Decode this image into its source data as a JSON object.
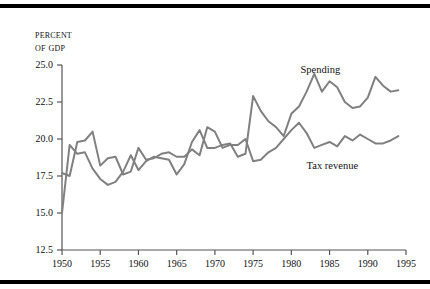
{
  "figure": {
    "axis_title_line1": "Percent",
    "axis_title_line2": "of GDP",
    "line_color": "#808080",
    "axis_color": "#555555",
    "rule_color": "#000000"
  },
  "chart_data": {
    "type": "line",
    "title": "",
    "xlabel": "",
    "ylabel": "Percent of GDP",
    "xlim": [
      1950,
      1995
    ],
    "ylim": [
      12.5,
      25.0
    ],
    "grid": false,
    "legend": "inline-annotations",
    "xticks": [
      1950,
      1955,
      1960,
      1965,
      1970,
      1975,
      1980,
      1985,
      1990,
      1995
    ],
    "yticks": [
      12.5,
      15.0,
      17.5,
      20.0,
      22.5,
      25.0
    ],
    "xtick_labels": [
      "1950",
      "1955",
      "1960",
      "1965",
      "1970",
      "1975",
      "1980",
      "1985",
      "1990",
      "1995"
    ],
    "ytick_labels": [
      "12.5",
      "15.0",
      "17.5",
      "20.0",
      "22.5",
      "25.0"
    ],
    "x": [
      1950,
      1951,
      1952,
      1953,
      1954,
      1955,
      1956,
      1957,
      1958,
      1959,
      1960,
      1961,
      1962,
      1963,
      1964,
      1965,
      1966,
      1967,
      1968,
      1969,
      1970,
      1971,
      1972,
      1973,
      1974,
      1975,
      1976,
      1977,
      1978,
      1979,
      1980,
      1981,
      1982,
      1983,
      1984,
      1985,
      1986,
      1987,
      1988,
      1989,
      1990,
      1991,
      1992,
      1993,
      1994
    ],
    "series": [
      {
        "name": "Spending",
        "label": "Spending",
        "color": "#808080",
        "values": [
          15.0,
          19.6,
          19.0,
          19.1,
          18.0,
          17.3,
          16.9,
          17.1,
          17.8,
          18.9,
          17.9,
          18.5,
          18.8,
          18.7,
          18.6,
          17.6,
          18.3,
          19.8,
          20.6,
          19.4,
          19.4,
          19.6,
          19.7,
          18.8,
          19.0,
          22.9,
          21.9,
          21.2,
          20.8,
          20.2,
          21.7,
          22.2,
          23.2,
          24.4,
          23.2,
          23.9,
          23.5,
          22.5,
          22.1,
          22.2,
          22.8,
          24.2,
          23.6,
          23.2,
          23.3
        ]
      },
      {
        "name": "Tax revenue",
        "label": "Tax revenue",
        "color": "#808080",
        "values": [
          17.7,
          17.5,
          19.8,
          19.9,
          20.5,
          18.2,
          18.7,
          18.8,
          17.6,
          17.8,
          19.4,
          18.6,
          18.7,
          19.0,
          19.1,
          18.8,
          18.8,
          19.3,
          18.9,
          20.8,
          20.5,
          19.4,
          19.6,
          19.6,
          20.0,
          18.5,
          18.6,
          19.1,
          19.4,
          20.0,
          20.6,
          21.1,
          20.4,
          19.4,
          19.6,
          19.8,
          19.5,
          20.2,
          19.9,
          20.3,
          20.0,
          19.7,
          19.7,
          19.9,
          20.2
        ]
      }
    ]
  },
  "annotations": [
    {
      "name": "spending-label",
      "text": "Spending"
    },
    {
      "name": "tax-revenue-label",
      "text": "Tax revenue"
    }
  ]
}
